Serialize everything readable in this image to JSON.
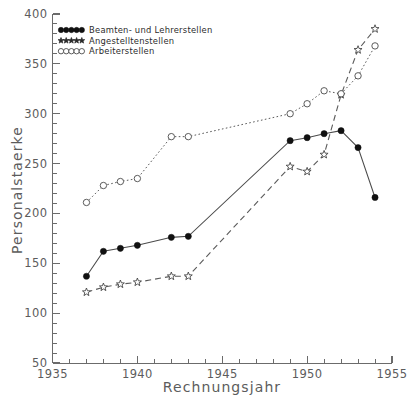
{
  "chart_data": {
    "type": "line",
    "title": "",
    "xlabel": "Rechnungsjahr",
    "ylabel": "Personalstaerke",
    "xlim": [
      1935,
      1955
    ],
    "ylim": [
      50,
      400
    ],
    "xticks": [
      1935,
      1940,
      1945,
      1950,
      1955
    ],
    "yticks": [
      50,
      100,
      150,
      200,
      250,
      300,
      350,
      400
    ],
    "grid": false,
    "legend_position": "top-left",
    "series": [
      {
        "name": "Beamten-  und Lehrerstellen",
        "marker": "filled-circle",
        "linestyle": "solid",
        "x": [
          1937,
          1938,
          1939,
          1940,
          1942,
          1943,
          1949,
          1950,
          1951,
          1952,
          1953,
          1954
        ],
        "values": [
          137,
          162,
          165,
          168,
          176,
          177,
          273,
          276,
          280,
          283,
          266,
          216
        ]
      },
      {
        "name": "Angestelltenstellen",
        "marker": "star",
        "linestyle": "dashed",
        "x": [
          1937,
          1938,
          1939,
          1940,
          1942,
          1943,
          1949,
          1950,
          1951,
          1952,
          1953,
          1954
        ],
        "values": [
          121,
          126,
          129,
          131,
          137,
          137,
          247,
          242,
          259,
          319,
          364,
          385
        ]
      },
      {
        "name": "Arbeiterstellen",
        "marker": "open-circle",
        "linestyle": "dotted",
        "x": [
          1937,
          1938,
          1939,
          1940,
          1942,
          1943,
          1949,
          1950,
          1951,
          1952,
          1953,
          1954
        ],
        "values": [
          211,
          228,
          232,
          235,
          277,
          277,
          300,
          310,
          323,
          320,
          338,
          368
        ]
      }
    ]
  },
  "legend": {
    "items": [
      {
        "label": "Beamten-  und Lehrerstellen",
        "marker": "filled-circle"
      },
      {
        "label": "Angestelltenstellen",
        "marker": "star"
      },
      {
        "label": "Arbeiterstellen",
        "marker": "open-circle"
      }
    ]
  },
  "axes": {
    "y_title": "Personalstaerke",
    "x_title": "Rechnungsjahr",
    "y_tick_labels": [
      "400",
      "350",
      "300",
      "250",
      "200",
      "150",
      "100",
      "50"
    ],
    "x_tick_labels": [
      "1935",
      "1940",
      "1945",
      "1950",
      "1955"
    ]
  },
  "colors": {
    "ink": "#2b2b2b",
    "axis": "#6b6b6b",
    "label": "#5c5c5c",
    "background": "#ffffff"
  }
}
